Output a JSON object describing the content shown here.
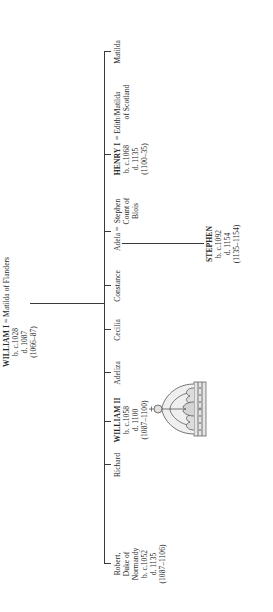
{
  "root": {
    "name": "WILLIAM I",
    "spouse": "Matilda of Flanders",
    "born": "b. c.1028",
    "died": "d. 1087",
    "reign": "(1066–87)"
  },
  "children": [
    {
      "name": "Robert,",
      "line2": "Duke of",
      "line3": "Normandy",
      "born": "b. c.1052",
      "died": "d. 1135",
      "reign": "(1087–1106)"
    },
    {
      "name": "Richard"
    },
    {
      "name": "WILLIAM II",
      "born": "b. c.1058",
      "died": "d. 1100",
      "reign": "(1087–1100)"
    },
    {
      "name": "Adeliza"
    },
    {
      "name": "Cecilia"
    },
    {
      "name": "Constance"
    },
    {
      "name": "Adela",
      "spouse": "Stephen",
      "spouse_line2": "Count of",
      "spouse_line3": "Blois"
    },
    {
      "name": "HENRY I",
      "spouse": "Edith/Matilda",
      "spouse_line2": "of Scotland",
      "born": "b. c.1068",
      "died": "d. 1135",
      "reign": "(1100–35)"
    },
    {
      "name": "Matilda"
    }
  ],
  "grandchild": {
    "name": "STEPHEN",
    "born": "b. c.1092",
    "died": "d. 1154",
    "reign": "(1135–1154)"
  },
  "marriage_symbol": "=",
  "decoration": "crown-illustration"
}
